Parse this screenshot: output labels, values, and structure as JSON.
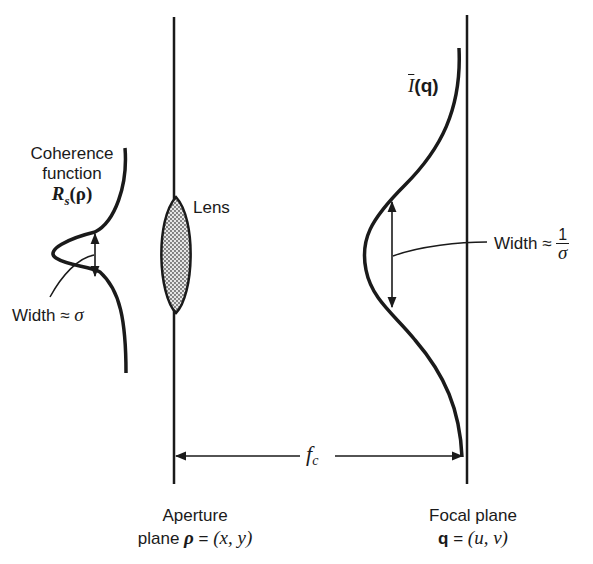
{
  "diagram": {
    "labels": {
      "coherence_line1": "Coherence",
      "coherence_line2": "function",
      "coherence_symbol": "R",
      "coherence_subscript": "s",
      "coherence_arg": "(ρ)",
      "width_left_text": "Width ≈ ",
      "width_left_symbol": "σ",
      "lens": "Lens",
      "intensity_symbol": "I",
      "intensity_arg": "(q)",
      "width_right_text": "Width ≈ ",
      "width_right_num": "1",
      "width_right_den": "σ",
      "focal_length_symbol": "f",
      "focal_length_subscript": "c",
      "aperture_line1": "Aperture",
      "aperture_line2_prefix": "plane ",
      "aperture_rho": "ρ",
      "aperture_eq": " = ",
      "aperture_coords": "(x, y)",
      "focal_line1": "Focal plane",
      "focal_q": "q",
      "focal_eq": " = ",
      "focal_coords": "(u, v)"
    },
    "colors": {
      "stroke": "#1a1a1a",
      "lens_fill": "#9a9a9a",
      "background": "#ffffff"
    }
  }
}
